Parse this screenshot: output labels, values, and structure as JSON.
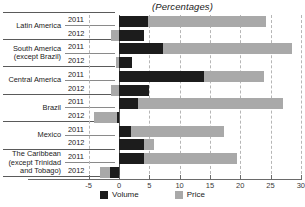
{
  "chart_data": {
    "type": "bar",
    "orientation": "horizontal",
    "stacked": true,
    "title": "(Percentages)",
    "xlabel": "",
    "ylabel": "",
    "xlim": [
      -5,
      30
    ],
    "xticks": [
      -5,
      0,
      5,
      10,
      15,
      20,
      25,
      30
    ],
    "xticklabels": [
      "-5",
      "0",
      "5",
      "10",
      "15",
      "20",
      "25",
      "30"
    ],
    "grid": true,
    "grid_style": "dashed vertical",
    "legend_position": "bottom-center",
    "legend": [
      {
        "name": "Volume",
        "color": "#1c1c1c"
      },
      {
        "name": "Price",
        "color": "#a9a9a9"
      }
    ],
    "series": [
      {
        "name": "Volume",
        "color": "#1c1c1c"
      },
      {
        "name": "Price",
        "color": "#a9a9a9"
      }
    ],
    "groups": [
      {
        "category": "Latin America",
        "category_lines": [
          "Latin America"
        ],
        "rows": [
          {
            "year": "2011",
            "volume": 4.8,
            "price": 19.5,
            "price_start": 4.8,
            "price_end": 24.3
          },
          {
            "year": "2012",
            "volume": 4.2,
            "price": -1.4,
            "price_start": -1.4,
            "price_end": 0
          }
        ]
      },
      {
        "category": "South America (except Brazil)",
        "category_lines": [
          "South America",
          "(except Brazil)"
        ],
        "rows": [
          {
            "year": "2011",
            "volume": 7.2,
            "price": 21.3,
            "price_start": 7.2,
            "price_end": 28.5
          },
          {
            "year": "2012",
            "volume": 2.1,
            "price": -0.5,
            "price_start": -0.5,
            "price_end": 0
          }
        ]
      },
      {
        "category": "Central America",
        "category_lines": [
          "Central America"
        ],
        "rows": [
          {
            "year": "2011",
            "volume": 14.1,
            "price": 9.9,
            "price_start": 14.1,
            "price_end": 24.0
          },
          {
            "year": "2012",
            "volume": 5.0,
            "price": -1.3,
            "price_start": -1.3,
            "price_end": 0
          }
        ]
      },
      {
        "category": "Brazil",
        "category_lines": [
          "Brazil"
        ],
        "rows": [
          {
            "year": "2011",
            "volume": 3.2,
            "price": 23.8,
            "price_start": 3.2,
            "price_end": 27.0
          },
          {
            "year": "2012",
            "volume": -0.4,
            "price": -4.1,
            "price_start": -4.1,
            "price_end": -0.4
          }
        ]
      },
      {
        "category": "Mexico",
        "category_lines": [
          "Mexico"
        ],
        "rows": [
          {
            "year": "2011",
            "volume": 2.0,
            "price": 15.3,
            "price_start": 2.0,
            "price_end": 17.3
          },
          {
            "year": "2012",
            "volume": 4.1,
            "price": 1.7,
            "price_start": 4.1,
            "price_end": 5.8
          }
        ]
      },
      {
        "category": "The Caribbean (except Trinidad and Tobago)",
        "category_lines": [
          "The Caribbean",
          "(except Trinidad",
          "and Tobago)"
        ],
        "rows": [
          {
            "year": "2011",
            "volume": 4.2,
            "price": 15.2,
            "price_start": 4.2,
            "price_end": 19.4
          },
          {
            "year": "2012",
            "volume": -1.5,
            "price": -1.6,
            "price_start": -3.1,
            "price_end": -1.5
          }
        ]
      }
    ]
  },
  "colors": {
    "volume": "#1c1c1c",
    "price": "#a9a9a9",
    "gridline": "#b6b6b6",
    "axis": "#6a6a6a",
    "text": "#1a1a1a",
    "background": "#ffffff"
  }
}
